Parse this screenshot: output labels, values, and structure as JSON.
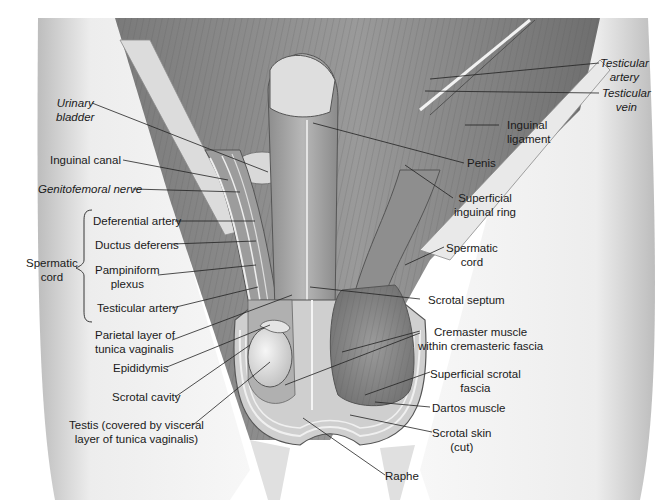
{
  "diagram": {
    "colors": {
      "background": "#ffffff",
      "ink": "#1a1a1a",
      "tissue_light": "#e6e6e6",
      "tissue_mid": "#a8a8a8",
      "tissue_dark": "#5e5e5e"
    }
  },
  "labels": {
    "urinary_bladder": "Urinary\nbladder",
    "inguinal_canal": "Inguinal canal",
    "genitofemoral_nerve": "Genitofemoral nerve",
    "spermatic_cord_group": "Spermatic\ncord",
    "deferential_artery": "Deferential artery",
    "ductus_deferens": "Ductus deferens",
    "pampiniform_plexus": "Pampiniform\nplexus",
    "testicular_artery_left": "Testicular artery",
    "parietal_layer": "Parietal layer of\ntunica vaginalis",
    "epididymis": "Epididymis",
    "scrotal_cavity": "Scrotal cavity",
    "testis": "Testis (covered by visceral\nlayer of tunica vaginalis)",
    "testicular_artery_right": "Testicular\nartery",
    "testicular_vein": "Testicular\nvein",
    "inguinal_ligament": "Inguinal\nligament",
    "penis": "Penis",
    "superficial_inguinal_ring": "Superficial\ninguinal ring",
    "spermatic_cord_right": "Spermatic\ncord",
    "scrotal_septum": "Scrotal septum",
    "cremaster_muscle": "Cremaster muscle\nwithin cremasteric fascia",
    "superficial_scrotal_fascia": "Superficial scrotal\nfascia",
    "dartos_muscle": "Dartos muscle",
    "scrotal_skin": "Scrotal skin\n(cut)",
    "raphe": "Raphe"
  }
}
